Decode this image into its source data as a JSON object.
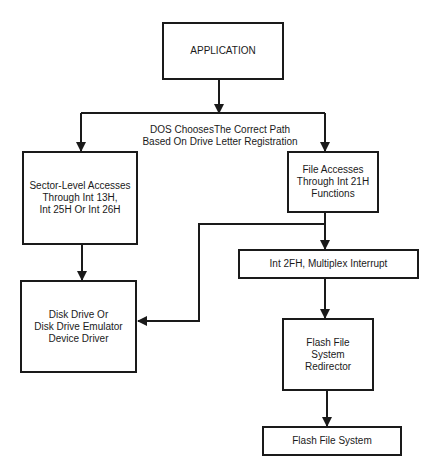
{
  "diagram": {
    "nodes": {
      "application": {
        "label": "APPLICATION"
      },
      "sector_level": {
        "label": "Sector-Level Accesses\nThrough Int 13H,\nInt 25H Or Int 26H"
      },
      "file_accesses": {
        "label": "File Accesses\nThrough Int 21H\nFunctions"
      },
      "multiplex": {
        "label": "Int 2FH, Multiplex Interrupt"
      },
      "disk_driver": {
        "label": "Disk Drive Or\nDisk Drive Emulator\nDevice Driver"
      },
      "redirector": {
        "label": "Flash File\nSystem\nRedirector"
      },
      "flash_fs": {
        "label": "Flash File System"
      }
    },
    "annotations": {
      "dos_choice": "DOS ChoosesThe Correct Path\nBased On Drive Letter Registration"
    },
    "edges": [
      {
        "from": "application",
        "to": "sector_level"
      },
      {
        "from": "application",
        "to": "file_accesses"
      },
      {
        "from": "sector_level",
        "to": "disk_driver"
      },
      {
        "from": "file_accesses",
        "to": "multiplex"
      },
      {
        "from": "file_accesses",
        "to": "disk_driver"
      },
      {
        "from": "multiplex",
        "to": "redirector"
      },
      {
        "from": "redirector",
        "to": "flash_fs"
      }
    ],
    "colors": {
      "line": "#1a1a1a",
      "background": "#ffffff"
    }
  }
}
